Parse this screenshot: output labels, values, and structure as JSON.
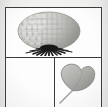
{
  "figure": {
    "kind": "scanned-figure-plate",
    "frame_color": "#3a3a3a",
    "page_color": "#f2f2f1",
    "panel_color": "#fdfdfd",
    "panels": [
      {
        "id": "panel-top",
        "position": "top",
        "subject": "puffball-fungus",
        "subject_label": "Reticulated puffball with basal rhizomorphs",
        "contents": [
          {
            "name": "puffball-body",
            "shape": "oval",
            "surface": "reticulate-polygonal-texture",
            "fill_light": "#d8d8d6",
            "fill_shadow": "#a9a9a6",
            "outline": "#8e8e8b"
          },
          {
            "name": "rhizomorph-filaments",
            "shape": "radiating-spikes",
            "count": 17,
            "color": "#1c1c1c",
            "location": "base"
          }
        ]
      },
      {
        "id": "panel-bottom-left",
        "position": "bottom-left",
        "subject": "empty",
        "subject_label": "",
        "contents": []
      },
      {
        "id": "panel-bottom-right",
        "position": "bottom-right",
        "subject": "cordate-leaf",
        "subject_label": "Heart-shaped leaf with petiole",
        "contents": [
          {
            "name": "leaf-blade",
            "shape": "cordate",
            "fill_light": "#b5b5b2",
            "fill_shadow": "#8f8f8c",
            "outline": "#7e7e7b"
          },
          {
            "name": "leaf-petiole",
            "shape": "stem",
            "direction": "down-left",
            "color": "#a0a09d"
          }
        ]
      }
    ]
  }
}
